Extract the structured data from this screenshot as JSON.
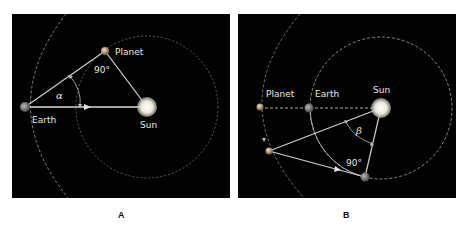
{
  "panels": [
    {
      "id": "A",
      "caption": "A",
      "labels": {
        "planet": "Planet",
        "earth": "Earth",
        "sun": "Sun",
        "right_angle": "90°",
        "angle": "α"
      },
      "description": "Inferior planet at greatest elongation: angle α between Earth–Sun line and Earth–Planet line, right angle at the planet"
    },
    {
      "id": "B",
      "caption": "B",
      "labels": {
        "planet": "Planet",
        "earth": "Earth",
        "sun": "Sun",
        "right_angle": "90°",
        "angle": "β"
      },
      "description": "Superior planet: opposition (Planet–Earth–Sun aligned) then quadrature with right angle at Earth; angle β at the Sun"
    }
  ],
  "colors": {
    "background": "#020202",
    "line": "#cfcfcf",
    "orbit": "#9a9a9a",
    "sun": "#f4f1e6",
    "label": "#e8e8e8"
  }
}
